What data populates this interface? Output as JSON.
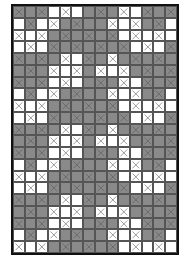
{
  "diagram": {
    "type": "grid-pattern",
    "rows": 21,
    "cols": 14,
    "colors": {
      "filled": "#8a8a8a",
      "empty": "#ffffff",
      "border": "#111111",
      "mark": "#555555"
    },
    "legend_codes": {
      "G": "gray cell",
      "W": "white cell",
      "x": "cell with X mark"
    },
    "tile_rows": [
      "GxG.GxW.WxW.GxG.GxW.WxW.GxG.",
      "x"
    ],
    "grid": [
      [
        "Gx",
        "G",
        "Gx",
        "W",
        "Wx",
        "W",
        "G",
        "Gx",
        "G",
        "Wx",
        "W",
        "Gx",
        "G",
        "Gx"
      ],
      [
        "W",
        "Gx",
        "W",
        "Wx",
        "G",
        "Gx",
        "G",
        "G",
        "Wx",
        "W",
        "Wx",
        "G",
        "Gx",
        "W"
      ],
      [
        "Wx",
        "W",
        "Wx",
        "G",
        "Gx",
        "G",
        "Gx",
        "G",
        "Gx",
        "W",
        "Wx",
        "W",
        "Wx",
        "W"
      ],
      [
        "W",
        "Wx",
        "W",
        "Gx",
        "G",
        "Gx",
        "G",
        "Gx",
        "G",
        "Gx",
        "W",
        "Wx",
        "W",
        "Gx"
      ],
      [
        "Gx",
        "G",
        "Gx",
        "G",
        "Wx",
        "W",
        "Gx",
        "G",
        "Wx",
        "G",
        "Gx",
        "G",
        "Gx",
        "G"
      ],
      [
        "G",
        "Gx",
        "G",
        "Wx",
        "W",
        "Wx",
        "G",
        "Wx",
        "W",
        "Wx",
        "G",
        "Gx",
        "G",
        "Gx"
      ],
      [
        "Gx",
        "G",
        "Gx",
        "W",
        "Wx",
        "W",
        "G",
        "Gx",
        "G",
        "Wx",
        "W",
        "Gx",
        "G",
        "Gx"
      ],
      [
        "W",
        "Gx",
        "W",
        "Wx",
        "G",
        "Gx",
        "G",
        "G",
        "Wx",
        "W",
        "Wx",
        "G",
        "Gx",
        "W"
      ],
      [
        "Wx",
        "W",
        "Wx",
        "G",
        "Gx",
        "G",
        "Gx",
        "G",
        "Gx",
        "W",
        "Wx",
        "W",
        "Wx",
        "W"
      ],
      [
        "W",
        "Wx",
        "W",
        "Gx",
        "G",
        "Gx",
        "G",
        "Gx",
        "G",
        "Gx",
        "W",
        "Wx",
        "W",
        "Gx"
      ],
      [
        "Gx",
        "G",
        "Gx",
        "G",
        "Wx",
        "W",
        "Gx",
        "G",
        "Wx",
        "G",
        "Gx",
        "G",
        "Gx",
        "G"
      ],
      [
        "G",
        "Gx",
        "G",
        "Wx",
        "W",
        "Wx",
        "G",
        "Wx",
        "W",
        "Wx",
        "G",
        "Gx",
        "G",
        "Gx"
      ],
      [
        "Gx",
        "G",
        "Gx",
        "W",
        "Wx",
        "W",
        "G",
        "Gx",
        "G",
        "Wx",
        "W",
        "Gx",
        "G",
        "Gx"
      ],
      [
        "W",
        "Gx",
        "W",
        "Wx",
        "G",
        "Gx",
        "G",
        "G",
        "Wx",
        "W",
        "Wx",
        "G",
        "Gx",
        "W"
      ],
      [
        "Wx",
        "W",
        "Wx",
        "G",
        "Gx",
        "G",
        "Gx",
        "G",
        "Gx",
        "W",
        "Wx",
        "W",
        "Wx",
        "W"
      ],
      [
        "W",
        "Wx",
        "W",
        "Gx",
        "G",
        "Gx",
        "G",
        "Gx",
        "G",
        "Gx",
        "W",
        "Wx",
        "W",
        "Gx"
      ],
      [
        "Gx",
        "G",
        "Gx",
        "G",
        "Wx",
        "W",
        "Gx",
        "G",
        "Wx",
        "G",
        "Gx",
        "G",
        "Gx",
        "G"
      ],
      [
        "G",
        "Gx",
        "G",
        "Wx",
        "W",
        "Wx",
        "G",
        "Wx",
        "W",
        "Wx",
        "G",
        "Gx",
        "G",
        "Gx"
      ],
      [
        "Gx",
        "G",
        "Gx",
        "W",
        "Wx",
        "W",
        "G",
        "Gx",
        "G",
        "Wx",
        "W",
        "Gx",
        "G",
        "Gx"
      ],
      [
        "W",
        "Gx",
        "W",
        "Wx",
        "G",
        "Gx",
        "G",
        "G",
        "Wx",
        "W",
        "Wx",
        "G",
        "Gx",
        "W"
      ],
      [
        "Wx",
        "W",
        "Wx",
        "G",
        "Gx",
        "G",
        "Gx",
        "G",
        "Gx",
        "W",
        "Wx",
        "W",
        "Wx",
        "W"
      ]
    ]
  }
}
